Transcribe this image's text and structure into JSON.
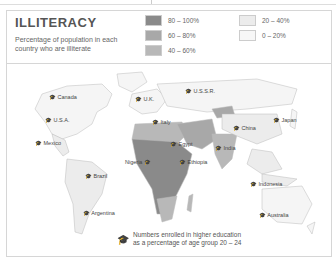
{
  "title": "ILLITERACY",
  "subtitle": "Percentage of population in each country who are illiterate",
  "legend": [
    {
      "label": "80 – 100%",
      "color": "#8a8a8a"
    },
    {
      "label": "60 – 80%",
      "color": "#a8a8a8"
    },
    {
      "label": "40 – 60%",
      "color": "#b8b8b8"
    },
    {
      "label": "20 – 40%",
      "color": "#ececec"
    },
    {
      "label": "0 – 20%",
      "color": "#f7f7f7"
    }
  ],
  "footnote": {
    "line1": "Numbers enrolled in higher education",
    "line2": "as a percentage of age group 20 – 24"
  },
  "countries": [
    {
      "name": "Canada"
    },
    {
      "name": "U.S.A."
    },
    {
      "name": "Mexico"
    },
    {
      "name": "Brazil"
    },
    {
      "name": "Argentina"
    },
    {
      "name": "U.K."
    },
    {
      "name": "U.S.S.R."
    },
    {
      "name": "Italy"
    },
    {
      "name": "Egypt"
    },
    {
      "name": "Nigeria"
    },
    {
      "name": "Ethiopia"
    },
    {
      "name": "China"
    },
    {
      "name": "India"
    },
    {
      "name": "Japan"
    },
    {
      "name": "Indonesia"
    },
    {
      "name": "Australia"
    }
  ]
}
